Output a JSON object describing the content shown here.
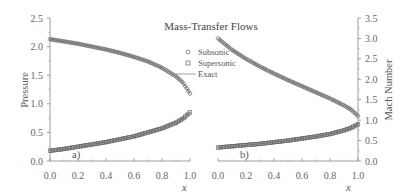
{
  "chart_data": {
    "type": "scatter",
    "title": "Mass-Transfer Flows",
    "legend": [
      {
        "label": "Subsonic",
        "marker": "circle"
      },
      {
        "label": "Supersonic",
        "marker": "square"
      },
      {
        "label": "Exact",
        "marker": "line"
      }
    ],
    "legend_position": "upper-center",
    "grid": false,
    "panels": [
      {
        "label": "a)",
        "xlabel": "x",
        "ylabel": "Pressure",
        "xlim": [
          0.0,
          1.0
        ],
        "ylim": [
          0.0,
          2.5
        ],
        "xticks": [
          "0.0",
          "0.2",
          "0.4",
          "0.6",
          "0.8",
          "1.0"
        ],
        "yticks": [
          "0.0",
          "0.5",
          "1.0",
          "1.5",
          "2.0",
          "2.5"
        ],
        "x": [
          0.0,
          0.1,
          0.2,
          0.3,
          0.4,
          0.5,
          0.6,
          0.7,
          0.8,
          0.9,
          0.95,
          1.0
        ],
        "series": [
          {
            "name": "Subsonic",
            "values": [
              2.13,
              2.09,
              2.05,
              2.0,
              1.95,
              1.89,
              1.82,
              1.74,
              1.63,
              1.48,
              1.37,
              1.18
            ]
          },
          {
            "name": "Supersonic",
            "values": [
              0.18,
              0.21,
              0.25,
              0.29,
              0.33,
              0.38,
              0.43,
              0.5,
              0.57,
              0.67,
              0.74,
              0.85
            ]
          }
        ]
      },
      {
        "label": "b)",
        "xlabel": "x",
        "ylabel": "Mach Number",
        "xlim": [
          0.0,
          1.0
        ],
        "ylim": [
          0.0,
          3.5
        ],
        "xticks": [
          "0.0",
          "0.2",
          "0.4",
          "0.6",
          "0.8",
          "1.0"
        ],
        "yticks": [
          "0.0",
          "0.5",
          "1.0",
          "1.5",
          "2.0",
          "2.5",
          "3.0",
          "3.5"
        ],
        "x": [
          0.0,
          0.1,
          0.2,
          0.3,
          0.4,
          0.5,
          0.6,
          0.7,
          0.8,
          0.9,
          0.95,
          1.0
        ],
        "series": [
          {
            "name": "Supersonic",
            "values": [
              3.0,
              2.72,
              2.5,
              2.31,
              2.14,
              1.98,
              1.83,
              1.68,
              1.53,
              1.36,
              1.26,
              1.1
            ]
          },
          {
            "name": "Subsonic",
            "values": [
              0.33,
              0.36,
              0.39,
              0.42,
              0.46,
              0.5,
              0.55,
              0.6,
              0.66,
              0.75,
              0.81,
              0.9
            ]
          }
        ]
      }
    ]
  },
  "colors": {
    "markers": "#6a6a6a",
    "axes": "#888888",
    "text": "#555555"
  }
}
